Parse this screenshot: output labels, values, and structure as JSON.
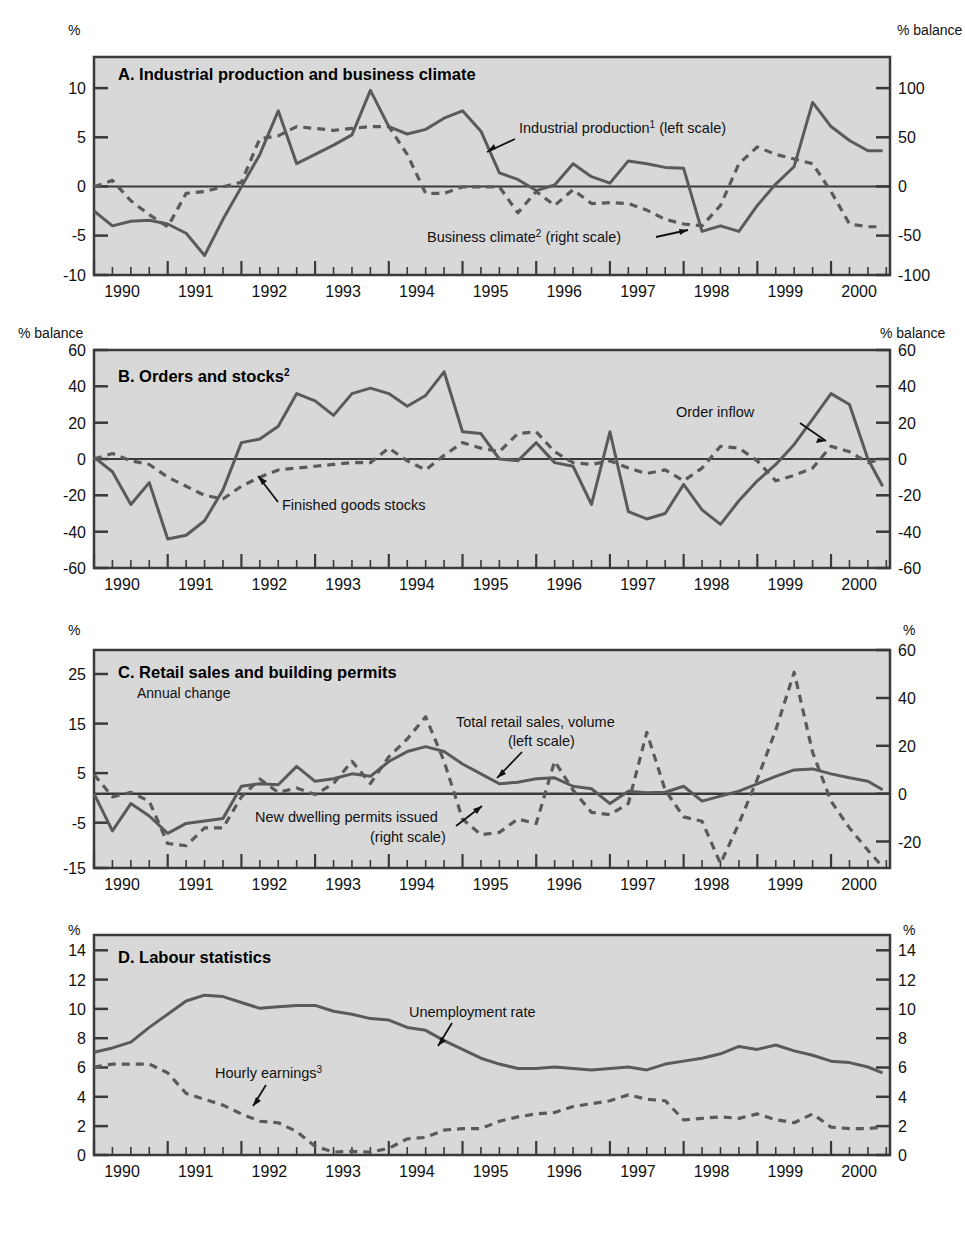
{
  "figure": {
    "colors": {
      "plot_background": "#d8d8d8",
      "frame": "#3a3a3a",
      "solid_series": "#5a5a5a",
      "dashed_series": "#5a5a5a",
      "text": "#111111"
    },
    "x_axis": {
      "years": [
        "1990",
        "1991",
        "1992",
        "1993",
        "1994",
        "1995",
        "1996",
        "1997",
        "1998",
        "1999",
        "2000"
      ],
      "x_min": 1989.6,
      "x_max": 2000.4,
      "minor_tick_interval_label": "quarterly"
    }
  },
  "panels": [
    {
      "id": "A",
      "title": "A.  Industrial production and business climate",
      "subtitle": "",
      "left_unit": "%",
      "right_unit": "% balance",
      "left_ticks": [
        "10",
        "5",
        "0",
        "-5",
        "-10"
      ],
      "right_ticks": [
        "100",
        "50",
        "0",
        "-50",
        "-100"
      ],
      "labels": [
        {
          "name": "industrial-production",
          "text": "Industrial production",
          "sup": "1",
          "suffix": " (left scale)"
        },
        {
          "name": "business-climate",
          "text": "Business climate",
          "sup": "2",
          "suffix": " (right scale)"
        }
      ]
    },
    {
      "id": "B",
      "title": "B.  Orders and stocks",
      "title_sup": "2",
      "subtitle": "",
      "left_unit": "% balance",
      "right_unit": "% balance",
      "left_ticks": [
        "60",
        "40",
        "20",
        "0",
        "-20",
        "-40",
        "-60"
      ],
      "right_ticks": [
        "60",
        "40",
        "20",
        "0",
        "-20",
        "-40",
        "-60"
      ],
      "labels": [
        {
          "name": "order-inflow",
          "text": "Order inflow",
          "sup": "",
          "suffix": ""
        },
        {
          "name": "finished-goods-stocks",
          "text": "Finished goods stocks",
          "sup": "",
          "suffix": ""
        }
      ]
    },
    {
      "id": "C",
      "title": "C.  Retail sales and building permits",
      "subtitle": "Annual change",
      "left_unit": "%",
      "right_unit": "%",
      "left_ticks": [
        "25",
        "15",
        "5",
        "-5",
        "-15"
      ],
      "right_ticks": [
        "60",
        "40",
        "20",
        "0",
        "-20"
      ],
      "labels": [
        {
          "name": "total-retail-sales",
          "text": "Total retail sales, volume",
          "sup": "",
          "suffix": "(left scale)"
        },
        {
          "name": "new-dwelling-permits",
          "text": "New dwelling permits issued",
          "sup": "",
          "suffix": "(right scale)"
        }
      ]
    },
    {
      "id": "D",
      "title": "D.  Labour statistics",
      "subtitle": "",
      "left_unit": "%",
      "right_unit": "%",
      "left_ticks": [
        "14",
        "12",
        "10",
        "8",
        "6",
        "4",
        "2",
        "0"
      ],
      "right_ticks": [
        "14",
        "12",
        "10",
        "8",
        "6",
        "4",
        "2",
        "0"
      ],
      "labels": [
        {
          "name": "unemployment-rate",
          "text": "Unemployment rate",
          "sup": "",
          "suffix": ""
        },
        {
          "name": "hourly-earnings",
          "text": "Hourly earnings",
          "sup": "3",
          "suffix": ""
        }
      ]
    }
  ],
  "chart_data": [
    {
      "type": "line",
      "panel": "A",
      "title": "A. Industrial production and business climate",
      "xlabel": "",
      "ylabel": "%",
      "ylabel_right": "% balance",
      "ylim": [
        -10,
        13.5
      ],
      "ylim_right": [
        -100,
        135
      ],
      "xlim": [
        1989.6,
        2000.4
      ],
      "grid": false,
      "legend": "inline-annotations",
      "series": [
        {
          "name": "Industrial production (left scale)",
          "style": "solid",
          "axis": "left",
          "x": [
            1989.6,
            1989.85,
            1990.1,
            1990.35,
            1990.6,
            1990.85,
            1991.1,
            1991.35,
            1991.6,
            1991.85,
            1992.1,
            1992.35,
            1992.6,
            1992.85,
            1993.1,
            1993.35,
            1993.6,
            1993.85,
            1994.1,
            1994.35,
            1994.6,
            1994.85,
            1995.1,
            1995.35,
            1995.6,
            1995.85,
            1996.1,
            1996.35,
            1996.6,
            1996.85,
            1997.1,
            1997.35,
            1997.6,
            1997.85,
            1998.1,
            1998.35,
            1998.6,
            1998.85,
            1999.1,
            1999.35,
            1999.6,
            1999.85,
            2000.1,
            2000.3
          ],
          "y": [
            -3.1,
            -4.7,
            -4.2,
            -4.1,
            -4.5,
            -5.5,
            -7.9,
            -4.0,
            -0.5,
            3.0,
            7.7,
            2.0,
            3.0,
            4.0,
            5.1,
            9.9,
            6.0,
            5.2,
            5.7,
            6.9,
            7.7,
            5.5,
            1.0,
            0.3,
            -0.9,
            -0.3,
            2.0,
            0.6,
            -0.1,
            2.3,
            2.0,
            1.6,
            1.5,
            -5.3,
            -4.7,
            -5.3,
            -2.5,
            -0.2,
            1.7,
            8.6,
            6.0,
            4.5,
            3.4,
            3.4
          ]
        },
        {
          "name": "Business climate (right scale)",
          "style": "dashed",
          "axis": "right",
          "x": [
            1989.6,
            1989.85,
            1990.1,
            1990.35,
            1990.6,
            1990.85,
            1991.1,
            1991.35,
            1991.6,
            1991.85,
            1992.1,
            1992.35,
            1992.6,
            1992.85,
            1993.1,
            1993.35,
            1993.6,
            1993.85,
            1994.1,
            1994.35,
            1994.6,
            1994.85,
            1995.1,
            1995.35,
            1995.6,
            1995.85,
            1996.1,
            1996.35,
            1996.6,
            1996.85,
            1997.1,
            1997.35,
            1997.6,
            1997.85,
            1998.1,
            1998.35,
            1998.6,
            1998.85,
            1999.1,
            1999.35,
            1999.6,
            1999.85,
            2000.1,
            2000.3
          ],
          "y": [
            -5,
            2,
            -20,
            -35,
            -48,
            -12,
            -10,
            -5,
            0,
            47,
            50,
            60,
            58,
            56,
            58,
            60,
            60,
            30,
            -12,
            -12,
            -5,
            -5,
            -5,
            -33,
            -10,
            -25,
            -8,
            -23,
            -22,
            -23,
            -30,
            -40,
            -45,
            -47,
            -25,
            20,
            38,
            30,
            25,
            20,
            -10,
            -45,
            -48,
            -48
          ]
        }
      ]
    },
    {
      "type": "line",
      "panel": "B",
      "title": "B. Orders and stocks",
      "xlabel": "",
      "ylabel": "% balance",
      "ylabel_right": "% balance",
      "ylim": [
        -60,
        60
      ],
      "ylim_right": [
        -60,
        60
      ],
      "xlim": [
        1989.6,
        2000.4
      ],
      "grid": false,
      "legend": "inline-annotations",
      "series": [
        {
          "name": "Order inflow",
          "style": "solid",
          "axis": "left",
          "x": [
            1989.6,
            1989.85,
            1990.1,
            1990.35,
            1990.6,
            1990.85,
            1991.1,
            1991.35,
            1991.6,
            1991.85,
            1992.1,
            1992.35,
            1992.6,
            1992.85,
            1993.1,
            1993.35,
            1993.6,
            1993.85,
            1994.1,
            1994.35,
            1994.6,
            1994.85,
            1995.1,
            1995.35,
            1995.6,
            1995.85,
            1996.1,
            1996.35,
            1996.6,
            1996.85,
            1997.1,
            1997.35,
            1997.6,
            1997.85,
            1998.1,
            1998.35,
            1998.6,
            1998.85,
            1999.1,
            1999.35,
            1999.6,
            1999.85,
            2000.1,
            2000.3
          ],
          "y": [
            1,
            -7,
            -25,
            -13,
            -44,
            -42,
            -34,
            -17,
            9,
            11,
            18,
            36,
            32,
            24,
            36,
            39,
            36,
            29,
            35,
            48,
            15,
            14,
            0,
            -1,
            9,
            -2,
            -4,
            -25,
            15,
            -29,
            -33,
            -30,
            -14,
            -28,
            -36,
            -23,
            -12,
            -3,
            8,
            22,
            36,
            30,
            0,
            -15
          ]
        },
        {
          "name": "Finished goods stocks",
          "style": "dashed",
          "axis": "left",
          "x": [
            1989.6,
            1989.85,
            1990.1,
            1990.35,
            1990.6,
            1990.85,
            1991.1,
            1991.35,
            1991.6,
            1991.85,
            1992.1,
            1992.35,
            1992.6,
            1992.85,
            1993.1,
            1993.35,
            1993.6,
            1993.85,
            1994.1,
            1994.35,
            1994.6,
            1994.85,
            1995.1,
            1995.35,
            1995.6,
            1995.85,
            1996.1,
            1996.35,
            1996.6,
            1996.85,
            1997.1,
            1997.35,
            1997.6,
            1997.85,
            1998.1,
            1998.35,
            1998.6,
            1998.85,
            1999.1,
            1999.35,
            1999.6,
            1999.85,
            2000.1,
            2000.3
          ],
          "y": [
            0,
            3,
            -1,
            -3,
            -10,
            -15,
            -20,
            -22,
            -15,
            -10,
            -6,
            -5,
            -4,
            -3,
            -2,
            -2,
            6,
            -1,
            -6,
            2,
            9,
            6,
            4,
            14,
            15,
            4,
            -2,
            -3,
            -1,
            -5,
            -8,
            -6,
            -12,
            -5,
            7,
            6,
            -1,
            -12,
            -9,
            -5,
            7,
            4,
            -2,
            0
          ]
        }
      ]
    },
    {
      "type": "line",
      "panel": "C",
      "title": "C. Retail sales and building permits",
      "subtitle": "Annual change",
      "xlabel": "",
      "ylabel": "%",
      "ylabel_right": "%",
      "ylim": [
        -15,
        29
      ],
      "ylim_right": [
        -30,
        68
      ],
      "xlim": [
        1989.6,
        2000.4
      ],
      "grid": false,
      "legend": "inline-annotations",
      "series": [
        {
          "name": "Total retail sales, volume (left scale)",
          "style": "solid",
          "axis": "left",
          "x": [
            1989.6,
            1989.85,
            1990.1,
            1990.35,
            1990.6,
            1990.85,
            1991.1,
            1991.35,
            1991.6,
            1991.85,
            1992.1,
            1992.35,
            1992.6,
            1992.85,
            1993.1,
            1993.35,
            1993.6,
            1993.85,
            1994.1,
            1994.35,
            1994.6,
            1994.85,
            1995.1,
            1995.35,
            1995.6,
            1995.85,
            1996.1,
            1996.35,
            1996.6,
            1996.85,
            1997.1,
            1997.35,
            1997.6,
            1997.85,
            1998.1,
            1998.35,
            1998.6,
            1998.85,
            1999.1,
            1999.35,
            1999.6,
            1999.85,
            2000.1,
            2000.3
          ],
          "y": [
            0.0,
            -7.5,
            -2.0,
            -4.5,
            -8.0,
            -6.0,
            -5.5,
            -5.0,
            1.5,
            2.0,
            1.8,
            5.5,
            2.5,
            3.0,
            4.0,
            3.5,
            6.5,
            8.5,
            9.5,
            8.5,
            6.0,
            4.0,
            2.0,
            2.3,
            3.0,
            3.2,
            1.5,
            1.0,
            -2.0,
            0.5,
            0.2,
            0.3,
            1.5,
            -1.5,
            -0.5,
            0.5,
            2.0,
            3.5,
            4.8,
            5.0,
            4.0,
            3.2,
            2.5,
            0.8
          ]
        },
        {
          "name": "New dwelling permits issued (right scale)",
          "style": "dashed",
          "axis": "right",
          "x": [
            1989.6,
            1989.85,
            1990.1,
            1990.35,
            1990.6,
            1990.85,
            1991.1,
            1991.35,
            1991.6,
            1991.85,
            1992.1,
            1992.35,
            1992.6,
            1992.85,
            1993.1,
            1993.35,
            1993.6,
            1993.85,
            1994.1,
            1994.35,
            1994.6,
            1994.85,
            1995.1,
            1995.35,
            1995.6,
            1995.85,
            1996.1,
            1996.35,
            1996.6,
            1996.85,
            1997.1,
            1997.35,
            1997.6,
            1997.85,
            1998.1,
            1998.35,
            1998.6,
            1998.85,
            1999.1,
            1999.35,
            1999.6,
            1999.85,
            2000.1,
            2000.3
          ],
          "y": [
            12,
            2,
            4,
            0,
            -19,
            -20,
            -12,
            -12,
            2,
            10,
            4,
            6,
            3,
            8,
            18,
            8,
            20,
            28,
            38,
            18,
            -8,
            -15,
            -14,
            -8,
            -10,
            18,
            5,
            -5,
            -6,
            -1,
            31,
            5,
            -7,
            -9,
            -28,
            -10,
            10,
            32,
            58,
            22,
            0,
            -12,
            -22,
            -30
          ]
        }
      ]
    },
    {
      "type": "line",
      "panel": "D",
      "title": "D. Labour statistics",
      "xlabel": "",
      "ylabel": "%",
      "ylabel_right": "%",
      "ylim": [
        0,
        15
      ],
      "ylim_right": [
        0,
        15
      ],
      "xlim": [
        1989.6,
        2000.4
      ],
      "grid": false,
      "legend": "inline-annotations",
      "series": [
        {
          "name": "Unemployment rate",
          "style": "solid",
          "axis": "left",
          "x": [
            1989.6,
            1989.85,
            1990.1,
            1990.35,
            1990.6,
            1990.85,
            1991.1,
            1991.35,
            1991.6,
            1991.85,
            1992.1,
            1992.35,
            1992.6,
            1992.85,
            1993.1,
            1993.35,
            1993.6,
            1993.85,
            1994.1,
            1994.35,
            1994.6,
            1994.85,
            1995.1,
            1995.35,
            1995.6,
            1995.85,
            1996.1,
            1996.35,
            1996.6,
            1996.85,
            1997.1,
            1997.35,
            1997.6,
            1997.85,
            1998.1,
            1998.35,
            1998.6,
            1998.85,
            1999.1,
            1999.35,
            1999.6,
            1999.85,
            2000.1,
            2000.3
          ],
          "y": [
            7.0,
            7.3,
            7.7,
            8.7,
            9.6,
            10.5,
            10.9,
            10.8,
            10.4,
            10.0,
            10.1,
            10.2,
            10.2,
            9.8,
            9.6,
            9.3,
            9.2,
            8.7,
            8.5,
            7.8,
            7.2,
            6.6,
            6.2,
            5.9,
            5.9,
            6.0,
            5.9,
            5.8,
            5.9,
            6.0,
            5.8,
            6.2,
            6.4,
            6.6,
            6.9,
            7.4,
            7.2,
            7.5,
            7.1,
            6.8,
            6.4,
            6.3,
            6.0,
            5.6
          ]
        },
        {
          "name": "Hourly earnings",
          "style": "dashed",
          "axis": "left",
          "x": [
            1989.6,
            1989.85,
            1990.1,
            1990.35,
            1990.6,
            1990.85,
            1991.1,
            1991.35,
            1991.6,
            1991.85,
            1992.1,
            1992.35,
            1992.6,
            1992.85,
            1993.1,
            1993.35,
            1993.6,
            1993.85,
            1994.1,
            1994.35,
            1994.6,
            1994.85,
            1995.1,
            1995.35,
            1995.6,
            1995.85,
            1996.1,
            1996.35,
            1996.6,
            1996.85,
            1997.1,
            1997.35,
            1997.6,
            1997.85,
            1998.1,
            1998.35,
            1998.6,
            1998.85,
            1999.1,
            1999.35,
            1999.6,
            1999.85,
            2000.1,
            2000.3
          ],
          "y": [
            6.0,
            6.2,
            6.2,
            6.2,
            5.6,
            4.2,
            3.8,
            3.4,
            2.8,
            2.3,
            2.2,
            1.6,
            0.6,
            0.2,
            0.25,
            0.2,
            0.45,
            1.1,
            1.2,
            1.7,
            1.8,
            1.8,
            2.3,
            2.6,
            2.8,
            2.9,
            3.3,
            3.5,
            3.7,
            4.1,
            3.8,
            3.7,
            2.4,
            2.5,
            2.6,
            2.5,
            2.8,
            2.4,
            2.2,
            2.8,
            1.9,
            1.8,
            1.8,
            1.9
          ]
        }
      ]
    }
  ]
}
